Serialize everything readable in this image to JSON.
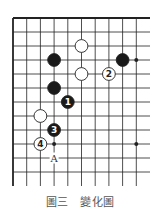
{
  "diagram": {
    "title": "圖三　變化圖",
    "grid": {
      "origin_x": 13,
      "origin_y": 18,
      "col_spacing": 13.7,
      "row_spacing": 14,
      "cols": 10,
      "rows": 12,
      "right_extent": 150,
      "bottom_extent": 186,
      "edges": [
        "left",
        "top"
      ]
    },
    "colors": {
      "line": "#222222",
      "black_stone": "#1a1a1a",
      "white_stone": "#ffffff",
      "stone_border": "#222222",
      "caption": "#555555"
    },
    "star_points": [
      {
        "col": 9,
        "row": 3
      },
      {
        "col": 3,
        "row": 9
      },
      {
        "col": 9,
        "row": 9
      }
    ],
    "stones": [
      {
        "color": "white",
        "col": 5,
        "row": 2,
        "label": ""
      },
      {
        "color": "black",
        "col": 3,
        "row": 3,
        "label": ""
      },
      {
        "color": "black",
        "col": 8,
        "row": 3,
        "label": ""
      },
      {
        "color": "white",
        "col": 5,
        "row": 4,
        "label": ""
      },
      {
        "color": "white",
        "col": 7,
        "row": 4,
        "label": "2"
      },
      {
        "color": "black",
        "col": 3,
        "row": 5,
        "label": ""
      },
      {
        "color": "black",
        "col": 4,
        "row": 6,
        "label": "1"
      },
      {
        "color": "white",
        "col": 2,
        "row": 7,
        "label": ""
      },
      {
        "color": "black",
        "col": 3,
        "row": 8,
        "label": "3"
      },
      {
        "color": "white",
        "col": 2,
        "row": 9,
        "label": "4"
      }
    ],
    "markers": [
      {
        "col": 3,
        "row": 10,
        "label": "A"
      }
    ]
  }
}
